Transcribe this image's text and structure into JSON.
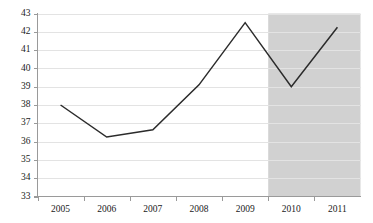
{
  "chart_data": {
    "type": "line",
    "title": "",
    "subtitle": "",
    "xlabel": "",
    "ylabel": "",
    "categories": [
      "2005",
      "2006",
      "2007",
      "2008",
      "2009",
      "2010",
      "2011"
    ],
    "values": [
      38.0,
      36.25,
      36.65,
      39.1,
      42.5,
      39.0,
      42.25
    ],
    "series": [
      {
        "name": "",
        "values": [
          38.0,
          36.25,
          36.65,
          39.1,
          42.5,
          39.0,
          42.25
        ],
        "color": "#2b2b2b"
      }
    ],
    "ylim": [
      33,
      43
    ],
    "xlim": [
      "2005",
      "2011"
    ],
    "ytick_labels": [
      "33",
      "34",
      "35",
      "36",
      "37",
      "38",
      "39",
      "40",
      "41",
      "42",
      "43"
    ],
    "ytick_values": [
      33,
      34,
      35,
      36,
      37,
      38,
      39,
      40,
      41,
      42,
      43
    ],
    "xtick_labels": [
      "2005",
      "2006",
      "2007",
      "2008",
      "2009",
      "2010",
      "2011"
    ],
    "grid": true,
    "grid_axis": "y",
    "legend": false,
    "legend_position": "none",
    "annotations": [
      {
        "type": "shaded-region",
        "name": "forecast-band",
        "from": "2009.5",
        "to": "2011.5",
        "color": "#d1d1d1",
        "label": ""
      }
    ],
    "colors": {
      "line": "#2b2b2b",
      "gridline": "#e3e3e3",
      "axis": "#9a9a9a",
      "shaded_region": "#d1d1d1",
      "background": "#ffffff",
      "tick_label": "#1a1a1a"
    }
  }
}
